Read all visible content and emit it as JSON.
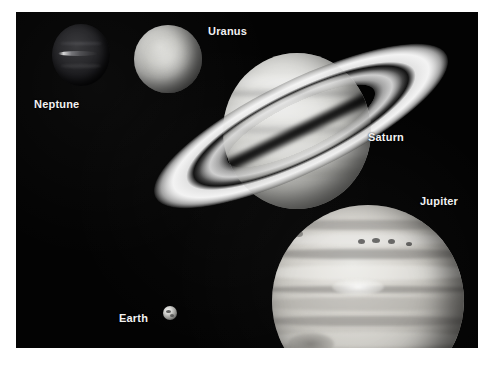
{
  "image": {
    "title": "Solar System Gas Giants Size Comparison",
    "background_color": "#030303",
    "border_color": "#ffffff",
    "label_color": "#f2f2f2"
  },
  "labels": [
    {
      "id": "neptune",
      "text": "Neptune"
    },
    {
      "id": "uranus",
      "text": "Uranus"
    },
    {
      "id": "saturn",
      "text": "Saturn"
    },
    {
      "id": "jupiter",
      "text": "Jupiter"
    },
    {
      "id": "earth",
      "text": "Earth"
    }
  ],
  "objects": {
    "neptune": {
      "name": "Neptune",
      "feature": "bright cloud streak"
    },
    "uranus": {
      "name": "Uranus",
      "feature": "featureless pale disk"
    },
    "saturn": {
      "name": "Saturn",
      "feature": "ring system with Cassini division"
    },
    "jupiter": {
      "name": "Jupiter",
      "feature": "cloud bands and Great Red Spot"
    },
    "earth": {
      "name": "Earth",
      "feature": "small reference disk"
    }
  }
}
